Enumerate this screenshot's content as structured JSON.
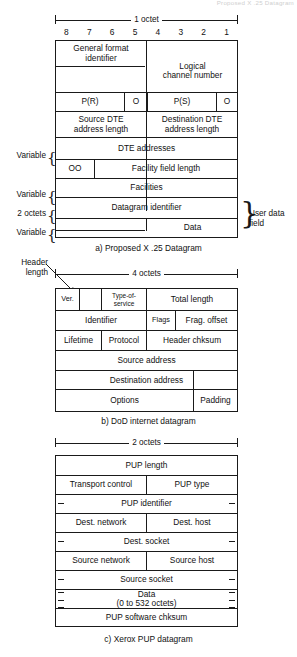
{
  "top_ghost_text": "Proposed X .25 Datagram",
  "diagrams": [
    {
      "id": "x25",
      "caption": "a) Proposed X .25 Datagram",
      "ruler_label": "1 octet",
      "bit_numbers": [
        "8",
        "7",
        "6",
        "5",
        "4",
        "3",
        "2",
        "1"
      ],
      "side_labels": [
        {
          "text": "Variable"
        },
        {
          "text": "Variable"
        },
        {
          "text": "2 octets"
        },
        {
          "text": "Variable"
        }
      ],
      "right_label": "User data\nfield",
      "fields": [
        "General format\nidentifier",
        "Logical\nchannel number",
        "P(R)",
        "O",
        "P(S)",
        "O",
        "Source DTE\naddress length",
        "Destination DTE\naddress length",
        "DTE addresses",
        "OO",
        "Facility field length",
        "Facilities",
        "Datagram identifier",
        "Data"
      ]
    },
    {
      "id": "dod",
      "caption": "b) DoD internet datagram",
      "ruler_label": "4 octets",
      "pointer_label": "Header\nlength",
      "fields": [
        "Ver.",
        "Type-of-\nservice",
        "Total length",
        "Identifier",
        "Flags",
        "Frag. offset",
        "Lifetime",
        "Protocol",
        "Header chksum",
        "Source address",
        "Destination address",
        "Options",
        "Padding"
      ]
    },
    {
      "id": "pup",
      "caption": "c) Xerox PUP datagram",
      "ruler_label": "2 octets",
      "fields": [
        "PUP length",
        "Transport control",
        "PUP type",
        "PUP identifier",
        "Dest. network",
        "Dest. host",
        "Dest. socket",
        "Source network",
        "Source host",
        "Source socket",
        "Data\n(0 to 532 octets)",
        "PUP software chksum"
      ]
    }
  ]
}
